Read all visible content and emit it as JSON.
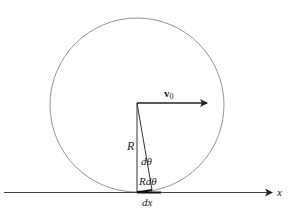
{
  "diagram": {
    "labels": {
      "velocity": "v",
      "velocity_sub": "0",
      "radius": "R",
      "angle": "dθ",
      "arc": "Rdθ",
      "displacement": "dx",
      "axis": "x"
    },
    "colors": {
      "stroke": "#333333",
      "circle": "#888888",
      "background": "#ffffff"
    }
  }
}
